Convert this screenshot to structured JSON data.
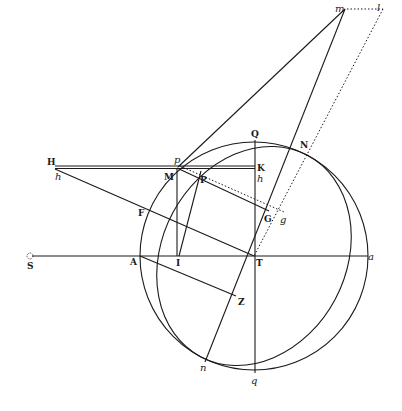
{
  "figure": {
    "labels": {
      "H": "H",
      "h_left": "h",
      "p": "p",
      "M": "M",
      "P": "P",
      "K": "K",
      "h_right": "h",
      "Q": "Q",
      "N": "N",
      "m": "m",
      "l": "l",
      "G": "G",
      "g": "g",
      "F": "F",
      "S": "S",
      "A": "A",
      "I": "I",
      "T": "T",
      "a": "a",
      "Z": "Z",
      "n": "n",
      "q": "q"
    },
    "colors": {
      "ink": "#1a1a1a",
      "background": "#ffffff"
    }
  }
}
